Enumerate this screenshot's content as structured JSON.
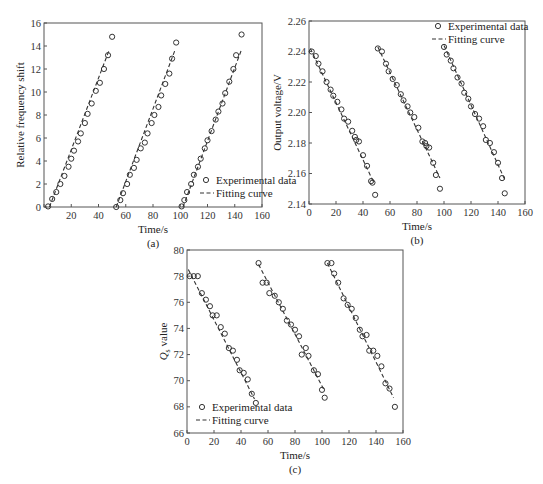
{
  "chart_data": [
    {
      "id": "a",
      "type": "scatter",
      "caption": "(a)",
      "title": "",
      "xlabel": "Time/s",
      "ylabel": "Relative frequency shift",
      "xlim": [
        0,
        160
      ],
      "ylim": [
        0,
        16
      ],
      "xticks": [
        0,
        20,
        40,
        60,
        80,
        100,
        120,
        140,
        160
      ],
      "yticks": [
        0,
        2,
        4,
        6,
        8,
        10,
        12,
        14,
        16
      ],
      "xtick_labels": [
        "",
        "20",
        "40",
        "60",
        "80",
        "100",
        "120",
        "140",
        "160"
      ],
      "ytick_labels": [
        "0",
        "2",
        "4",
        "6",
        "8",
        "10",
        "12",
        "14",
        "16"
      ],
      "grid": false,
      "legend": {
        "position": "lower right",
        "entries": [
          "Experimental data",
          "Fitting curve"
        ]
      },
      "frame": {
        "left": 44,
        "top": 23,
        "right": 262,
        "bottom": 207
      },
      "legend_box": {
        "x": 200,
        "y": 180
      },
      "series": [
        {
          "name": "Experimental data",
          "kind": "markers",
          "points": [
            [
              3,
              0.05
            ],
            [
              6,
              0.7
            ],
            [
              9,
              1.3
            ],
            [
              12,
              2.0
            ],
            [
              15,
              2.7
            ],
            [
              18,
              3.5
            ],
            [
              20,
              4.2
            ],
            [
              22,
              4.9
            ],
            [
              25,
              5.7
            ],
            [
              27,
              6.4
            ],
            [
              30,
              7.3
            ],
            [
              32,
              8.1
            ],
            [
              35,
              9.0
            ],
            [
              38,
              10.1
            ],
            [
              41,
              10.8
            ],
            [
              44,
              12.0
            ],
            [
              47,
              13.2
            ],
            [
              50,
              14.8
            ],
            [
              53,
              0.0
            ],
            [
              56,
              0.6
            ],
            [
              58,
              1.2
            ],
            [
              61,
              2.0
            ],
            [
              63,
              2.8
            ],
            [
              66,
              3.4
            ],
            [
              68,
              4.1
            ],
            [
              71,
              5.1
            ],
            [
              74,
              5.6
            ],
            [
              76,
              6.4
            ],
            [
              79,
              7.3
            ],
            [
              81,
              8.0
            ],
            [
              84,
              8.7
            ],
            [
              86,
              9.7
            ],
            [
              89,
              10.7
            ],
            [
              92,
              11.6
            ],
            [
              94,
              12.9
            ],
            [
              97,
              14.3
            ],
            [
              101,
              0.05
            ],
            [
              103,
              0.6
            ],
            [
              105,
              1.3
            ],
            [
              108,
              2.0
            ],
            [
              110,
              2.8
            ],
            [
              113,
              3.5
            ],
            [
              115,
              4.2
            ],
            [
              118,
              5.1
            ],
            [
              120,
              5.8
            ],
            [
              123,
              6.6
            ],
            [
              126,
              7.6
            ],
            [
              128,
              8.3
            ],
            [
              131,
              9.0
            ],
            [
              133,
              9.9
            ],
            [
              136,
              10.9
            ],
            [
              139,
              12.0
            ],
            [
              141,
              13.2
            ],
            [
              145,
              15.0
            ]
          ]
        },
        {
          "name": "Fitting curve",
          "kind": "dashed",
          "segments": [
            [
              [
                4,
                0
              ],
              [
                48,
                13.7
              ]
            ],
            [
              [
                53,
                0
              ],
              [
                96,
                13.6
              ]
            ],
            [
              [
                102,
                0
              ],
              [
                145,
                13.7
              ]
            ]
          ]
        }
      ]
    },
    {
      "id": "b",
      "type": "scatter",
      "caption": "(b)",
      "title": "",
      "xlabel": "Time/s",
      "ylabel": "Output voltage/V",
      "xlim": [
        0,
        160
      ],
      "ylim": [
        2.14,
        2.26
      ],
      "xticks": [
        0,
        20,
        40,
        60,
        80,
        100,
        120,
        140,
        160
      ],
      "yticks": [
        2.14,
        2.16,
        2.18,
        2.2,
        2.22,
        2.24,
        2.26
      ],
      "xtick_labels": [
        "0",
        "20",
        "40",
        "60",
        "80",
        "100",
        "120",
        "140",
        "160"
      ],
      "ytick_labels": [
        "2.14",
        "2.16",
        "2.18",
        "2.20",
        "2.22",
        "2.24",
        "2.26"
      ],
      "grid": false,
      "legend": {
        "position": "upper right",
        "entries": [
          "Experimental data",
          "Fitting curve"
        ]
      },
      "frame": {
        "left": 309,
        "top": 21,
        "right": 525,
        "bottom": 204
      },
      "legend_box": {
        "x": 432,
        "y": 26
      },
      "series": [
        {
          "name": "Experimental data",
          "kind": "markers",
          "points": [
            [
              2,
              2.24
            ],
            [
              5,
              2.237
            ],
            [
              7,
              2.232
            ],
            [
              10,
              2.227
            ],
            [
              13,
              2.22
            ],
            [
              16,
              2.215
            ],
            [
              18,
              2.211
            ],
            [
              21,
              2.207
            ],
            [
              24,
              2.202
            ],
            [
              26,
              2.196
            ],
            [
              29,
              2.194
            ],
            [
              32,
              2.188
            ],
            [
              34,
              2.184
            ],
            [
              35,
              2.182
            ],
            [
              37,
              2.181
            ],
            [
              40,
              2.172
            ],
            [
              43,
              2.165
            ],
            [
              46,
              2.155
            ],
            [
              47,
              2.154
            ],
            [
              49,
              2.146
            ],
            [
              51,
              2.242
            ],
            [
              54,
              2.24
            ],
            [
              57,
              2.232
            ],
            [
              59,
              2.227
            ],
            [
              62,
              2.222
            ],
            [
              65,
              2.218
            ],
            [
              68,
              2.212
            ],
            [
              70,
              2.208
            ],
            [
              73,
              2.204
            ],
            [
              75,
              2.2
            ],
            [
              78,
              2.197
            ],
            [
              81,
              2.19
            ],
            [
              84,
              2.181
            ],
            [
              86,
              2.18
            ],
            [
              87,
              2.178
            ],
            [
              89,
              2.177
            ],
            [
              92,
              2.167
            ],
            [
              94,
              2.159
            ],
            [
              97,
              2.15
            ],
            [
              100,
              2.243
            ],
            [
              102,
              2.238
            ],
            [
              105,
              2.234
            ],
            [
              107,
              2.229
            ],
            [
              110,
              2.223
            ],
            [
              113,
              2.219
            ],
            [
              115,
              2.213
            ],
            [
              118,
              2.209
            ],
            [
              120,
              2.204
            ],
            [
              123,
              2.199
            ],
            [
              126,
              2.196
            ],
            [
              129,
              2.191
            ],
            [
              131,
              2.182
            ],
            [
              134,
              2.18
            ],
            [
              137,
              2.174
            ],
            [
              140,
              2.167
            ],
            [
              143,
              2.157
            ],
            [
              145,
              2.147
            ]
          ]
        },
        {
          "name": "Fitting curve",
          "kind": "dashed",
          "segments": [
            [
              [
                1,
                2.242
              ],
              [
                48,
                2.154
              ]
            ],
            [
              [
                51,
                2.243
              ],
              [
                97,
                2.157
              ]
            ],
            [
              [
                100,
                2.244
              ],
              [
                145,
                2.156
              ]
            ]
          ]
        }
      ]
    },
    {
      "id": "c",
      "type": "scatter",
      "caption": "(c)",
      "title": "",
      "xlabel": "Time/s",
      "ylabel": "Qs value",
      "ylabel_main": "Q",
      "ylabel_sub": "s",
      "ylabel_rest": " value",
      "xlim": [
        0,
        160
      ],
      "ylim": [
        66,
        80
      ],
      "xticks": [
        0,
        20,
        40,
        60,
        80,
        100,
        120,
        140,
        160
      ],
      "yticks": [
        66,
        68,
        70,
        72,
        74,
        76,
        78,
        80
      ],
      "xtick_labels": [
        "0",
        "20",
        "40",
        "60",
        "80",
        "100",
        "120",
        "140",
        "160"
      ],
      "ytick_labels": [
        "66",
        "68",
        "70",
        "72",
        "74",
        "76",
        "78",
        "80"
      ],
      "grid": false,
      "legend": {
        "position": "lower left",
        "entries": [
          "Experimental data",
          "Fitting curve"
        ]
      },
      "frame": {
        "left": 187,
        "top": 250,
        "right": 403,
        "bottom": 433
      },
      "legend_box": {
        "x": 196,
        "y": 407
      },
      "series": [
        {
          "name": "Experimental data",
          "kind": "markers",
          "points": [
            [
              2,
              78.0
            ],
            [
              5,
              78.0
            ],
            [
              8,
              78.0
            ],
            [
              11,
              76.7
            ],
            [
              14,
              76.2
            ],
            [
              17,
              75.7
            ],
            [
              19,
              75.0
            ],
            [
              22,
              75.0
            ],
            [
              25,
              74.1
            ],
            [
              28,
              73.6
            ],
            [
              31,
              72.5
            ],
            [
              34,
              72.3
            ],
            [
              37,
              71.6
            ],
            [
              39,
              70.8
            ],
            [
              42,
              70.6
            ],
            [
              45,
              70.1
            ],
            [
              48,
              69.0
            ],
            [
              51,
              68.3
            ],
            [
              53,
              79.0
            ],
            [
              56,
              77.5
            ],
            [
              59,
              77.5
            ],
            [
              61,
              76.7
            ],
            [
              65,
              76.5
            ],
            [
              68,
              76.0
            ],
            [
              71,
              75.5
            ],
            [
              74,
              74.6
            ],
            [
              77,
              74.3
            ],
            [
              80,
              73.9
            ],
            [
              83,
              73.4
            ],
            [
              85,
              72.0
            ],
            [
              88,
              72.5
            ],
            [
              90,
              71.9
            ],
            [
              94,
              70.8
            ],
            [
              97,
              70.5
            ],
            [
              100,
              69.3
            ],
            [
              102,
              68.7
            ],
            [
              104,
              79.0
            ],
            [
              107,
              79.0
            ],
            [
              109,
              78.2
            ],
            [
              112,
              77.5
            ],
            [
              116,
              76.3
            ],
            [
              119,
              75.8
            ],
            [
              122,
              75.5
            ],
            [
              125,
              74.8
            ],
            [
              128,
              73.9
            ],
            [
              130,
              73.4
            ],
            [
              133,
              73.5
            ],
            [
              135,
              72.3
            ],
            [
              138,
              72.3
            ],
            [
              141,
              71.9
            ],
            [
              144,
              71.1
            ],
            [
              147,
              69.8
            ],
            [
              150,
              69.4
            ],
            [
              154,
              68.0
            ]
          ]
        },
        {
          "name": "Fitting curve",
          "kind": "dashed",
          "segments": [
            [
              [
                1,
                78.5
              ],
              [
                50,
                68.6
              ]
            ],
            [
              [
                53,
                78.9
              ],
              [
                102,
                69.2
              ]
            ],
            [
              [
                104,
                79.0
              ],
              [
                153,
                68.7
              ]
            ]
          ]
        }
      ]
    }
  ]
}
